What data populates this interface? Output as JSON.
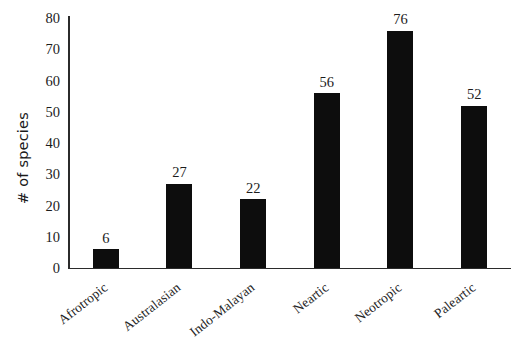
{
  "chart_data": {
    "type": "bar",
    "title": "",
    "xlabel": "",
    "ylabel": "# of species",
    "categories": [
      "Afrotropic",
      "Australasian",
      "Indo-Malayan",
      "Neartic",
      "Neotropic",
      "Paleartic"
    ],
    "values": [
      6,
      27,
      22,
      56,
      76,
      52
    ],
    "value_labels": [
      "6",
      "27",
      "22",
      "56",
      "76",
      "52"
    ],
    "ylim": [
      0,
      80
    ],
    "y_ticks": [
      0,
      10,
      20,
      30,
      40,
      50,
      60,
      70,
      80
    ],
    "y_tick_labels": [
      "0",
      "10",
      "20",
      "30",
      "40",
      "50",
      "60",
      "70",
      "80"
    ],
    "grid": false,
    "legend": false,
    "legend_position": "none",
    "bar_color": "#0d0d0d",
    "axis_color": "#2b2b2b",
    "background_color": "#ffffff",
    "label_rotation_degrees": -38
  }
}
